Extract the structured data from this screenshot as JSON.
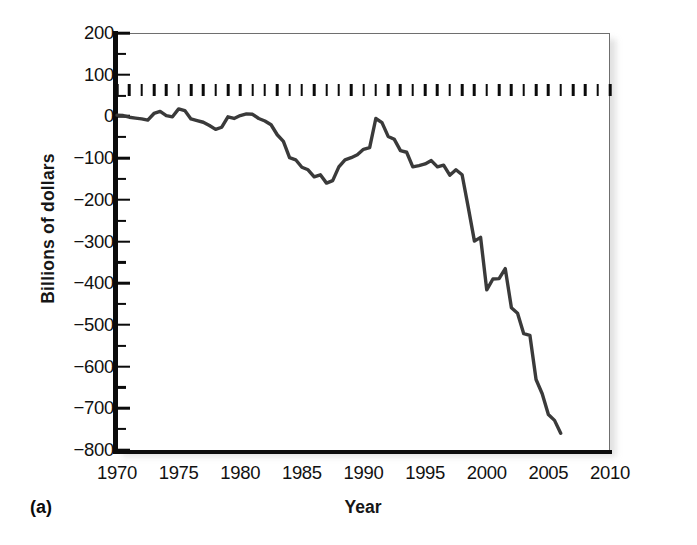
{
  "panel": {
    "label": "(a)"
  },
  "chart_data": {
    "type": "line",
    "title": "",
    "xlabel": "Year",
    "ylabel": "Billions of dollars",
    "xlim": [
      1970,
      2010
    ],
    "ylim": [
      -800,
      200
    ],
    "grid": false,
    "legend": null,
    "x_major_ticks": [
      1970,
      1975,
      1980,
      1985,
      1990,
      1995,
      2000,
      2005,
      2010
    ],
    "x_tick_labels": [
      "1970",
      "1975",
      "1980",
      "1985",
      "1990",
      "1995",
      "2000",
      "2005",
      "2010"
    ],
    "x_minor_tick_interval": 1,
    "y_major_ticks": [
      200,
      100,
      0,
      -100,
      -200,
      -300,
      -400,
      -500,
      -600,
      -700,
      -800
    ],
    "y_tick_labels": [
      "200",
      "100",
      "0",
      "−100",
      "−200",
      "−300",
      "−400",
      "−500",
      "−600",
      "−700",
      "−800"
    ],
    "y_minor_tick_interval": 50,
    "line_color": "#3a3a3a",
    "series": [
      {
        "name": "Trade balance",
        "x": [
          1970,
          1970.5,
          1971,
          1971.5,
          1972,
          1972.5,
          1973,
          1973.5,
          1974,
          1974.5,
          1975,
          1975.5,
          1976,
          1976.5,
          1977,
          1977.5,
          1978,
          1978.5,
          1979,
          1979.5,
          1980,
          1980.5,
          1981,
          1981.5,
          1982,
          1982.5,
          1983,
          1983.5,
          1984,
          1984.5,
          1985,
          1985.5,
          1986,
          1986.5,
          1987,
          1987.5,
          1988,
          1988.5,
          1989,
          1989.5,
          1990,
          1990.5,
          1991,
          1991.5,
          1992,
          1992.5,
          1993,
          1993.5,
          1994,
          1994.5,
          1995,
          1995.5,
          1996,
          1996.5,
          1997,
          1997.5,
          1998,
          1998.5,
          1999,
          1999.5,
          2000,
          2000.5,
          2001,
          2001.5,
          2002,
          2002.5,
          2003,
          2003.5,
          2004,
          2004.5,
          2005,
          2005.5,
          2006
        ],
        "y": [
          3,
          2,
          -2,
          -4,
          -6,
          -9,
          7,
          12,
          2,
          -1,
          18,
          14,
          -6,
          -10,
          -14,
          -22,
          -31,
          -26,
          -1,
          -5,
          2,
          6,
          5,
          -5,
          -11,
          -20,
          -44,
          -60,
          -99,
          -104,
          -122,
          -128,
          -145,
          -140,
          -160,
          -154,
          -121,
          -104,
          -99,
          -92,
          -79,
          -75,
          -5,
          -15,
          -48,
          -55,
          -82,
          -86,
          -121,
          -118,
          -114,
          -106,
          -121,
          -117,
          -141,
          -128,
          -140,
          -218,
          -299,
          -290,
          -416,
          -390,
          -389,
          -365,
          -459,
          -472,
          -521,
          -525,
          -631,
          -665,
          -715,
          -729,
          -760
        ]
      }
    ]
  }
}
